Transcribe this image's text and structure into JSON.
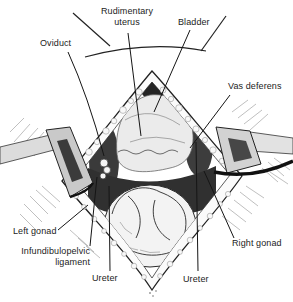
{
  "illustration": {
    "labels": [
      {
        "id": "rudimentary-uterus",
        "text": "Rudimentary uterus"
      },
      {
        "id": "bladder",
        "text": "Bladder"
      },
      {
        "id": "oviduct",
        "text": "Oviduct"
      },
      {
        "id": "vas-deferens",
        "text": "Vas deferens"
      },
      {
        "id": "left-gonad",
        "text": "Left gonad"
      },
      {
        "id": "infundibulopelvic-ligament",
        "text": "Infundibulopelvic ligament"
      },
      {
        "id": "ureter-left",
        "text": "Ureter"
      },
      {
        "id": "ureter-right",
        "text": "Ureter"
      },
      {
        "id": "right-gonad",
        "text": "Right gonad"
      }
    ],
    "colors": {
      "ink": "#1c1c1c",
      "paper": "#ffffff"
    }
  }
}
